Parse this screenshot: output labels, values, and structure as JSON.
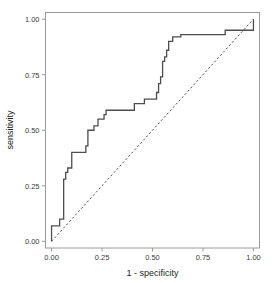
{
  "chart_data": {
    "type": "line",
    "title": "",
    "xlabel": "1 - specificity",
    "ylabel": "sensitivity",
    "xlim": [
      -0.03,
      1.03
    ],
    "ylim": [
      -0.03,
      1.03
    ],
    "xticks": [
      0.0,
      0.25,
      0.5,
      0.75,
      1.0
    ],
    "yticks": [
      0.0,
      0.25,
      0.5,
      0.75,
      1.0
    ],
    "xtick_labels": [
      "0.00",
      "0.25",
      "0.50",
      "0.75",
      "1.00"
    ],
    "ytick_labels": [
      "0.00",
      "0.25",
      "0.50",
      "0.75",
      "1.00"
    ],
    "grid": false,
    "legend": null,
    "series": [
      {
        "name": "ROC curve",
        "style": "step",
        "color": "#4d4d4d",
        "x": [
          0.0,
          0.0,
          0.02,
          0.02,
          0.04,
          0.04,
          0.05,
          0.05,
          0.06,
          0.06,
          0.07,
          0.07,
          0.08,
          0.08,
          0.1,
          0.1,
          0.13,
          0.13,
          0.17,
          0.17,
          0.18,
          0.18,
          0.21,
          0.21,
          0.23,
          0.23,
          0.25,
          0.25,
          0.26,
          0.26,
          0.27,
          0.27,
          0.29,
          0.29,
          0.41,
          0.41,
          0.43,
          0.43,
          0.46,
          0.46,
          0.5,
          0.5,
          0.52,
          0.52,
          0.53,
          0.53,
          0.54,
          0.54,
          0.55,
          0.55,
          0.56,
          0.56,
          0.57,
          0.57,
          0.58,
          0.58,
          0.6,
          0.6,
          0.64,
          0.64,
          0.71,
          0.71,
          0.86,
          0.86,
          0.97,
          0.97,
          1.0,
          1.0
        ],
        "y": [
          0.0,
          0.07,
          0.07,
          0.07,
          0.07,
          0.1,
          0.1,
          0.1,
          0.1,
          0.28,
          0.28,
          0.31,
          0.31,
          0.33,
          0.33,
          0.4,
          0.4,
          0.4,
          0.4,
          0.43,
          0.43,
          0.5,
          0.5,
          0.52,
          0.52,
          0.55,
          0.55,
          0.55,
          0.55,
          0.57,
          0.57,
          0.59,
          0.59,
          0.59,
          0.59,
          0.62,
          0.62,
          0.62,
          0.62,
          0.64,
          0.64,
          0.64,
          0.64,
          0.67,
          0.67,
          0.71,
          0.71,
          0.74,
          0.74,
          0.81,
          0.81,
          0.83,
          0.83,
          0.86,
          0.86,
          0.9,
          0.9,
          0.92,
          0.92,
          0.93,
          0.93,
          0.93,
          0.93,
          0.95,
          0.95,
          0.95,
          0.95,
          1.0
        ]
      },
      {
        "name": "chance diagonal",
        "style": "dashed",
        "color": "#555555",
        "x": [
          0.0,
          1.0
        ],
        "y": [
          0.0,
          1.0
        ]
      }
    ]
  },
  "figure": {
    "panel_border_color": "#9a9a9a",
    "background_color": "#ffffff",
    "axis_text_color": "#3a3a3a",
    "axis_title_color": "#1c1c1c"
  }
}
